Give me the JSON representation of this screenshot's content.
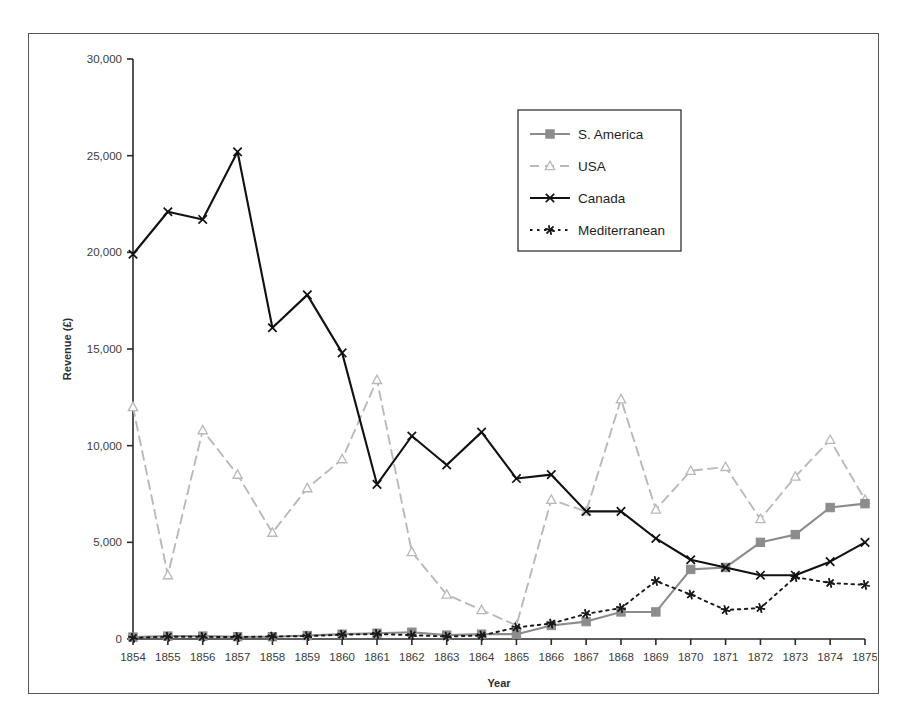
{
  "chart_data": {
    "type": "line",
    "title": "",
    "xlabel": "Year",
    "ylabel": "Revenue (£)",
    "x": [
      1854,
      1855,
      1856,
      1857,
      1858,
      1859,
      1860,
      1861,
      1862,
      1863,
      1864,
      1865,
      1866,
      1867,
      1868,
      1869,
      1870,
      1871,
      1872,
      1873,
      1874,
      1875
    ],
    "xtick_labels": [
      "1854",
      "1855",
      "1856",
      "1857",
      "1858",
      "1859",
      "1860",
      "1861",
      "1862",
      "1863",
      "1864",
      "1865",
      "1866",
      "1867",
      "1868",
      "1869",
      "1870",
      "1871",
      "1872",
      "1873",
      "1874",
      "1875"
    ],
    "ytick_labels": [
      "0",
      "5,000",
      "10,000",
      "15,000",
      "20,000",
      "25,000",
      "30,000"
    ],
    "ytick_values": [
      0,
      5000,
      10000,
      15000,
      20000,
      25000,
      30000
    ],
    "ylim": [
      0,
      30000
    ],
    "grid": false,
    "legend_position": "top-right",
    "series": [
      {
        "name": "S. America",
        "color": "#8c8c8c",
        "marker": "square",
        "dash": "solid",
        "values": [
          100,
          150,
          150,
          120,
          120,
          180,
          250,
          300,
          350,
          200,
          250,
          250,
          700,
          900,
          1400,
          1400,
          3600,
          3700,
          5000,
          5400,
          6800,
          7000
        ]
      },
      {
        "name": "USA",
        "color": "#b9b9b9",
        "marker": "triangle",
        "dash": "dashed",
        "values": [
          12000,
          3300,
          10800,
          8500,
          5500,
          7800,
          9300,
          13400,
          4500,
          2300,
          1500,
          700,
          7200,
          6600,
          12400,
          6700,
          8700,
          8900,
          6200,
          8400,
          10300,
          7200
        ]
      },
      {
        "name": "Canada",
        "color": "#111111",
        "marker": "cross",
        "dash": "solid",
        "values": [
          19900,
          22100,
          21700,
          25200,
          16100,
          17800,
          14800,
          8000,
          10500,
          9000,
          10700,
          8300,
          8500,
          6600,
          6600,
          5200,
          4100,
          3700,
          3300,
          3300,
          4000,
          5000
        ]
      },
      {
        "name": "Mediterranean",
        "color": "#1a1a1a",
        "marker": "asterisk",
        "dash": "dotted",
        "values": [
          60,
          120,
          110,
          100,
          130,
          150,
          220,
          260,
          200,
          130,
          180,
          600,
          800,
          1300,
          1600,
          3000,
          2300,
          1500,
          1600,
          3200,
          2900,
          2800
        ]
      }
    ]
  },
  "caption": {
    "text": ""
  }
}
